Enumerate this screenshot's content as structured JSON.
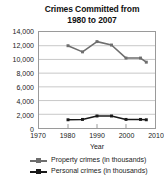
{
  "chart_data": {
    "type": "line",
    "title": "Crimes Committed from 1980 to 2007",
    "title_lines": [
      "Crimes Committed from",
      "1980 to 2007"
    ],
    "xlabel": "Year",
    "ylabel": "",
    "xlim": [
      1970,
      2010
    ],
    "ylim": [
      0,
      14000
    ],
    "grid": true,
    "grid_axis": "y",
    "legend_position": "bottom",
    "x_ticks": [
      1970,
      1980,
      1990,
      2000,
      2010
    ],
    "x_tick_labels": [
      "1970",
      "1980",
      "1990",
      "2000",
      "2010"
    ],
    "y_ticks": [
      0,
      2000,
      4000,
      6000,
      8000,
      10000,
      12000,
      14000
    ],
    "y_tick_labels": [
      "0",
      "2,000",
      "4,000",
      "6,000",
      "8,000",
      "10,000",
      "12,000",
      "14,000"
    ],
    "series": [
      {
        "name": "Property crimes (in thousands)",
        "color": "#6e6e6e",
        "marker": "square",
        "x": [
          1980,
          1985,
          1990,
          1995,
          2000,
          2005,
          2007
        ],
        "values": [
          12000,
          11100,
          12600,
          12100,
          10200,
          10200,
          9600
        ]
      },
      {
        "name": "Personal crimes (in thousands)",
        "color": "#1a1a1a",
        "marker": "square",
        "x": [
          1980,
          1985,
          1990,
          1995,
          2000,
          2005,
          2007
        ],
        "values": [
          1200,
          1250,
          1750,
          1750,
          1250,
          1250,
          1200
        ]
      }
    ]
  },
  "legend": {
    "items": [
      {
        "label": "Property crimes (in thousands)",
        "color": "#6e6e6e"
      },
      {
        "label": "Personal crimes (in thousands)",
        "color": "#1a1a1a"
      }
    ]
  },
  "colors": {
    "property": "#6e6e6e",
    "personal": "#1a1a1a",
    "gridline": "#c8c8c8",
    "frame": "#9a9a9a",
    "background": "#ffffff",
    "text": "#1a1a1a"
  }
}
